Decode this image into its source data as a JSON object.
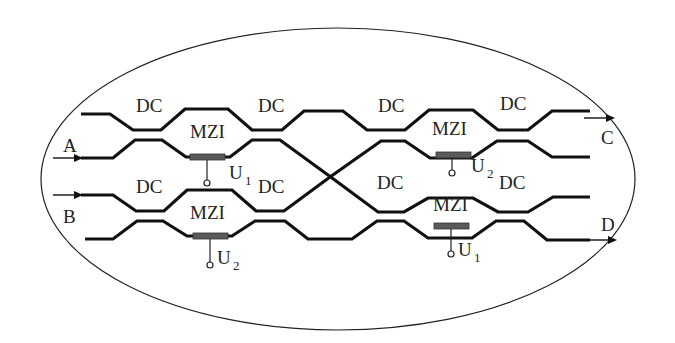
{
  "diagram": {
    "type": "photonic-circuit",
    "colors": {
      "waveguide": "#111111",
      "heater": "#5a5a5a",
      "boundary": "#222222",
      "background": "#ffffff"
    },
    "ports": {
      "input_a": "A",
      "input_b": "B",
      "output_c": "C",
      "output_d": "D"
    },
    "block_labels": {
      "dc": "DC",
      "mzi": "MZI"
    },
    "mzis": [
      {
        "id": "mzi-top-left",
        "label": "MZI",
        "voltage": "U",
        "subscript": "1"
      },
      {
        "id": "mzi-bottom-left",
        "label": "MZI",
        "voltage": "U",
        "subscript": "2"
      },
      {
        "id": "mzi-top-right",
        "label": "MZI",
        "voltage": "U",
        "subscript": "2"
      },
      {
        "id": "mzi-bottom-right",
        "label": "MZI",
        "voltage": "U",
        "subscript": "1"
      }
    ],
    "dcs": [
      {
        "id": "dc-top-1",
        "label": "DC"
      },
      {
        "id": "dc-top-2",
        "label": "DC"
      },
      {
        "id": "dc-top-3",
        "label": "DC"
      },
      {
        "id": "dc-top-4",
        "label": "DC"
      },
      {
        "id": "dc-bottom-1",
        "label": "DC"
      },
      {
        "id": "dc-bottom-2",
        "label": "DC"
      },
      {
        "id": "dc-bottom-3",
        "label": "DC"
      },
      {
        "id": "dc-bottom-4",
        "label": "DC"
      }
    ]
  }
}
